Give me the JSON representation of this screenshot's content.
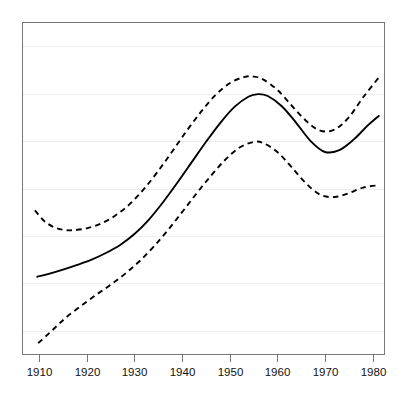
{
  "chart_data": {
    "type": "line",
    "title": "",
    "subtitle": "",
    "xlabel": "",
    "ylabel": "",
    "xlim": [
      1906.5,
      1982.5
    ],
    "ylim": [
      0,
      7
    ],
    "xticks": [
      1910,
      1920,
      1930,
      1940,
      1950,
      1960,
      1970,
      1980
    ],
    "xticklabels": [
      "1910",
      "1920",
      "1930",
      "1940",
      "1950",
      "1960",
      "1970",
      "1980"
    ],
    "yticks": [],
    "yticklabels": [],
    "grid": "horizontal",
    "gridline_values": [
      6.5,
      5.5,
      4.5,
      3.5,
      2.5,
      1.5,
      0.5
    ],
    "legend": "none",
    "annotations": [],
    "colors": {
      "line": "#000000",
      "grid": "#eeeeee",
      "frame": "#777777",
      "background": "#ffffff",
      "text": "#111111"
    },
    "series": [
      {
        "name": "fit",
        "style": "solid",
        "x": [
          1909.6,
          1912,
          1915,
          1918,
          1921,
          1924,
          1927,
          1930,
          1933,
          1936,
          1939,
          1942,
          1945,
          1948,
          1951,
          1954,
          1956,
          1958,
          1961,
          1964,
          1967,
          1970,
          1973,
          1976,
          1979,
          1981.3
        ],
        "y": [
          1.64,
          1.7,
          1.79,
          1.89,
          2.0,
          2.14,
          2.31,
          2.54,
          2.84,
          3.21,
          3.62,
          4.05,
          4.48,
          4.88,
          5.22,
          5.44,
          5.49,
          5.45,
          5.23,
          4.88,
          4.5,
          4.27,
          4.31,
          4.53,
          4.83,
          5.03
        ]
      },
      {
        "name": "upper-confidence-band",
        "style": "dashed",
        "x": [
          1909.1,
          1911,
          1913,
          1915,
          1917,
          1920,
          1923,
          1926,
          1929,
          1932,
          1935,
          1938,
          1941,
          1944,
          1947,
          1950,
          1953,
          1955,
          1957,
          1960,
          1963,
          1966,
          1969,
          1972,
          1975,
          1978,
          1981.3
        ],
        "y": [
          3.04,
          2.82,
          2.69,
          2.63,
          2.62,
          2.66,
          2.76,
          2.93,
          3.17,
          3.49,
          3.87,
          4.29,
          4.72,
          5.12,
          5.47,
          5.72,
          5.85,
          5.86,
          5.8,
          5.58,
          5.25,
          4.93,
          4.72,
          4.74,
          5.0,
          5.42,
          5.84
        ]
      },
      {
        "name": "lower-confidence-band",
        "style": "dashed",
        "x": [
          1909.8,
          1912,
          1914,
          1916,
          1919,
          1922,
          1925,
          1928,
          1931,
          1934,
          1937,
          1940,
          1943,
          1946,
          1949,
          1952,
          1955,
          1957,
          1960,
          1963,
          1966,
          1969,
          1972,
          1975,
          1978,
          1981.3
        ],
        "y": [
          0.24,
          0.44,
          0.63,
          0.81,
          1.04,
          1.26,
          1.47,
          1.7,
          1.96,
          2.27,
          2.62,
          3.0,
          3.39,
          3.76,
          4.1,
          4.36,
          4.48,
          4.46,
          4.27,
          3.95,
          3.61,
          3.37,
          3.32,
          3.4,
          3.52,
          3.57
        ]
      }
    ]
  }
}
